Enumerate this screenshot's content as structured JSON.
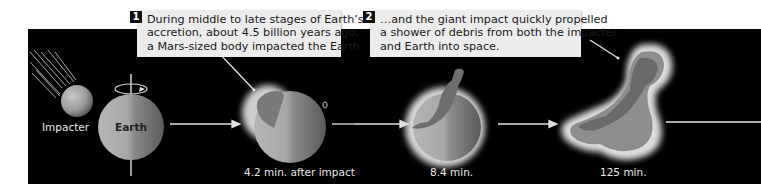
{
  "captions": [
    {
      "number": "1",
      "lines": [
        "During middle to late stages of  Earth’s",
        "accretion, about 4.5 billion years ago,",
        "a Mars-sized body impacted the Earth…"
      ]
    },
    {
      "number": "2",
      "lines": [
        "…and the giant impact quickly propelled",
        "a shower of debris from both the impacter",
        "and Earth into space."
      ]
    }
  ],
  "labels": {
    "impacter": "Impacter",
    "earth": "Earth"
  },
  "stages": [
    {
      "time": "4.2 min. after impact"
    },
    {
      "time": "8.4 min."
    },
    {
      "time": "125 min."
    }
  ],
  "colors": {
    "background": "#000000",
    "caption_bg": "#ececec",
    "sphere": "#9a9a9a",
    "glow": "#d8d8d8",
    "arrow": "#e0e0e0"
  }
}
